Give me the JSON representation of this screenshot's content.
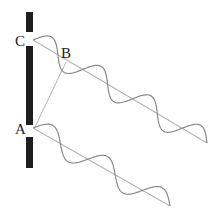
{
  "diagram": {
    "labels": {
      "a": "A",
      "b": "B",
      "c": "C"
    },
    "colors": {
      "barrier": "#1e1e1e",
      "wave": "#8a8a8a",
      "ray": "#b5b5b5",
      "text": "#222222"
    },
    "barrier": {
      "x": 29.5,
      "segments": [
        [
          12,
          32
        ],
        [
          46,
          125
        ],
        [
          137,
          168
        ]
      ]
    },
    "slits": [
      {
        "name": "C",
        "x": 33,
        "y": 40
      },
      {
        "name": "A",
        "x": 33,
        "y": 128
      }
    ],
    "rays": [
      {
        "from": "C",
        "to": [
          207,
          143
        ]
      },
      {
        "from": "A",
        "to": [
          170,
          206
        ]
      },
      {
        "from": "A",
        "to": "B",
        "b": [
          66,
          62
        ]
      }
    ]
  }
}
